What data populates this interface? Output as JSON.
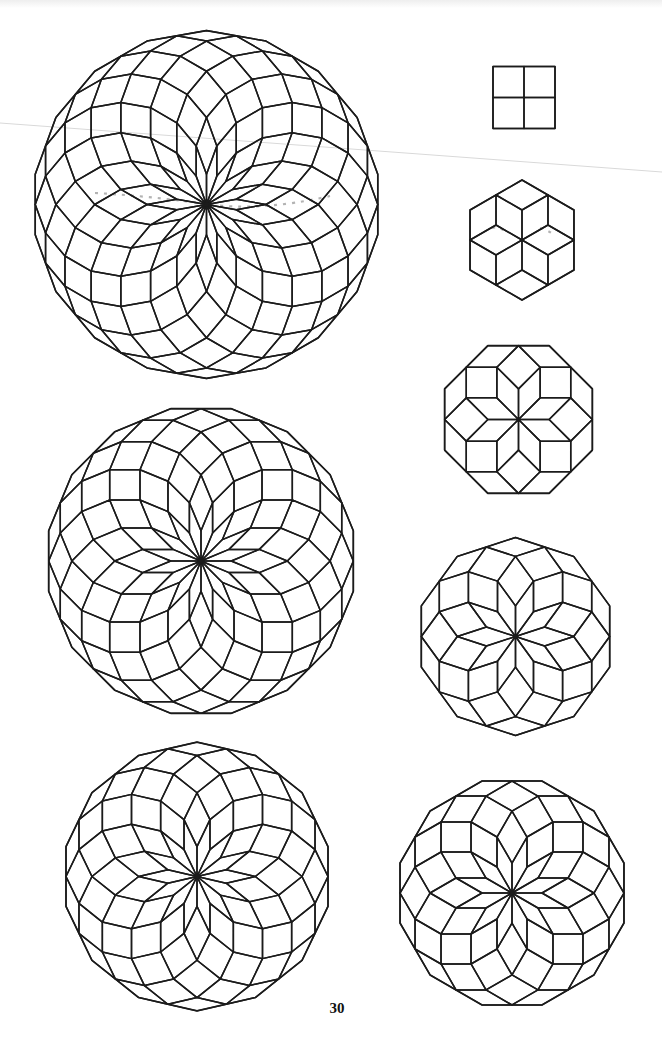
{
  "page": {
    "number": "30",
    "stroke_color": "#1b1b1b",
    "background": "#ffffff"
  },
  "figures": [
    {
      "id": "square-4gon",
      "n": 2,
      "sides": 4,
      "cx": 524,
      "cy": 97.5,
      "unit": 31.0,
      "rhombi": 4
    },
    {
      "id": "hexagon-6gon",
      "n": 3,
      "sides": 6,
      "cx": 522,
      "cy": 240,
      "unit": 30.0,
      "rhombi": 12
    },
    {
      "id": "octagon-8gon",
      "n": 4,
      "sides": 8,
      "cx": 518.5,
      "cy": 419.5,
      "unit": 30.6,
      "rhombi": 24
    },
    {
      "id": "decagon-10gon",
      "n": 5,
      "sides": 10,
      "cx": 515.5,
      "cy": 636.5,
      "unit": 30.6,
      "rhombi": 40
    },
    {
      "id": "dodecagon-12gon",
      "n": 6,
      "sides": 12,
      "cx": 512,
      "cy": 893,
      "unit": 30.0,
      "rhombi": 60
    },
    {
      "id": "tetradecagon-14gon",
      "n": 7,
      "sides": 14,
      "cx": 197,
      "cy": 876.5,
      "unit": 29.9,
      "rhombi": 84
    },
    {
      "id": "hexadecagon-16gon",
      "n": 8,
      "sides": 16,
      "cx": 201,
      "cy": 561,
      "unit": 30.3,
      "rhombi": 112
    },
    {
      "id": "octadecagon-18gon",
      "n": 9,
      "sides": 18,
      "cx": 206.5,
      "cy": 204.5,
      "unit": 30.2,
      "rhombi": 144
    }
  ]
}
